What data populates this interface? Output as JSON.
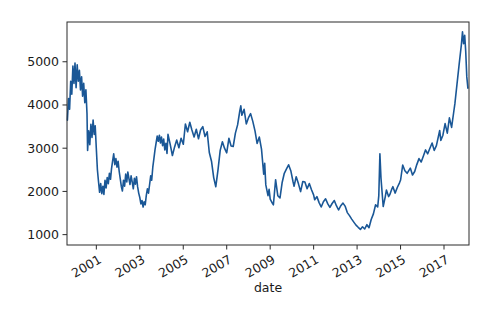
{
  "figure": {
    "background": "#ffffff",
    "frame_color": "#2b2b2b",
    "tick_color": "#2b2b2b",
    "label_color": "#1a1a1a"
  },
  "chart_data": {
    "type": "line",
    "xlabel": "date",
    "ylabel": "",
    "x_ticks": [
      2001,
      2003,
      2005,
      2007,
      2009,
      2011,
      2013,
      2015,
      2017
    ],
    "y_ticks": [
      1000,
      2000,
      3000,
      4000,
      5000
    ],
    "xlim": [
      1999.65,
      2018.15
    ],
    "ylim": [
      760,
      5920
    ],
    "grid": false,
    "legend": "none",
    "line_color": "#1a5796",
    "series": [
      {
        "name": "value",
        "points": [
          [
            1999.67,
            3650
          ],
          [
            1999.72,
            4150
          ],
          [
            1999.77,
            3900
          ],
          [
            1999.82,
            4550
          ],
          [
            1999.87,
            4250
          ],
          [
            1999.92,
            4900
          ],
          [
            1999.97,
            4500
          ],
          [
            2000.02,
            4970
          ],
          [
            2000.07,
            4400
          ],
          [
            2000.12,
            4930
          ],
          [
            2000.17,
            4550
          ],
          [
            2000.22,
            4800
          ],
          [
            2000.27,
            4350
          ],
          [
            2000.32,
            4650
          ],
          [
            2000.37,
            4200
          ],
          [
            2000.42,
            4500
          ],
          [
            2000.47,
            4050
          ],
          [
            2000.52,
            4350
          ],
          [
            2000.57,
            3800
          ],
          [
            2000.6,
            2950
          ],
          [
            2000.65,
            3400
          ],
          [
            2000.7,
            3080
          ],
          [
            2000.75,
            3550
          ],
          [
            2000.8,
            3250
          ],
          [
            2000.85,
            3650
          ],
          [
            2000.9,
            3320
          ],
          [
            2000.95,
            3520
          ],
          [
            2001.0,
            3000
          ],
          [
            2001.05,
            2500
          ],
          [
            2001.1,
            2230
          ],
          [
            2001.15,
            1980
          ],
          [
            2001.2,
            2180
          ],
          [
            2001.25,
            1950
          ],
          [
            2001.3,
            2120
          ],
          [
            2001.35,
            1930
          ],
          [
            2001.4,
            2260
          ],
          [
            2001.45,
            2080
          ],
          [
            2001.5,
            2320
          ],
          [
            2001.55,
            2180
          ],
          [
            2001.6,
            2420
          ],
          [
            2001.65,
            2280
          ],
          [
            2001.7,
            2520
          ],
          [
            2001.75,
            2700
          ],
          [
            2001.8,
            2870
          ],
          [
            2001.85,
            2620
          ],
          [
            2001.9,
            2760
          ],
          [
            2001.95,
            2560
          ],
          [
            2002.0,
            2700
          ],
          [
            2002.05,
            2460
          ],
          [
            2002.1,
            2300
          ],
          [
            2002.15,
            2120
          ],
          [
            2002.2,
            2010
          ],
          [
            2002.25,
            2260
          ],
          [
            2002.3,
            2120
          ],
          [
            2002.35,
            2400
          ],
          [
            2002.4,
            2220
          ],
          [
            2002.45,
            2450
          ],
          [
            2002.5,
            2300
          ],
          [
            2002.55,
            2160
          ],
          [
            2002.6,
            2360
          ],
          [
            2002.65,
            2220
          ],
          [
            2002.7,
            2060
          ],
          [
            2002.75,
            2300
          ],
          [
            2002.8,
            2170
          ],
          [
            2002.85,
            2340
          ],
          [
            2002.9,
            2110
          ],
          [
            2002.95,
            1960
          ],
          [
            2003.0,
            1860
          ],
          [
            2003.05,
            1710
          ],
          [
            2003.1,
            1790
          ],
          [
            2003.15,
            1640
          ],
          [
            2003.2,
            1760
          ],
          [
            2003.25,
            1690
          ],
          [
            2003.3,
            1910
          ],
          [
            2003.35,
            2060
          ],
          [
            2003.4,
            1960
          ],
          [
            2003.45,
            2160
          ],
          [
            2003.5,
            2360
          ],
          [
            2003.55,
            2260
          ],
          [
            2003.6,
            2560
          ],
          [
            2003.65,
            2760
          ],
          [
            2003.7,
            2960
          ],
          [
            2003.75,
            3120
          ],
          [
            2003.8,
            3280
          ],
          [
            2003.85,
            3160
          ],
          [
            2003.9,
            3300
          ],
          [
            2003.95,
            3120
          ],
          [
            2004.0,
            3260
          ],
          [
            2004.05,
            3060
          ],
          [
            2004.1,
            3210
          ],
          [
            2004.15,
            2960
          ],
          [
            2004.2,
            3110
          ],
          [
            2004.25,
            2880
          ],
          [
            2004.3,
            3320
          ],
          [
            2004.4,
            3090
          ],
          [
            2004.5,
            2830
          ],
          [
            2004.6,
            3030
          ],
          [
            2004.7,
            3190
          ],
          [
            2004.8,
            3010
          ],
          [
            2004.9,
            3230
          ],
          [
            2005.0,
            3090
          ],
          [
            2005.1,
            3560
          ],
          [
            2005.2,
            3380
          ],
          [
            2005.3,
            3600
          ],
          [
            2005.4,
            3420
          ],
          [
            2005.5,
            3260
          ],
          [
            2005.6,
            3440
          ],
          [
            2005.7,
            3220
          ],
          [
            2005.8,
            3420
          ],
          [
            2005.9,
            3500
          ],
          [
            2006.0,
            3270
          ],
          [
            2006.1,
            3380
          ],
          [
            2006.2,
            2900
          ],
          [
            2006.3,
            2700
          ],
          [
            2006.4,
            2320
          ],
          [
            2006.5,
            2110
          ],
          [
            2006.6,
            2500
          ],
          [
            2006.7,
            2950
          ],
          [
            2006.8,
            3150
          ],
          [
            2006.9,
            3000
          ],
          [
            2007.0,
            2890
          ],
          [
            2007.1,
            3230
          ],
          [
            2007.2,
            3050
          ],
          [
            2007.3,
            3040
          ],
          [
            2007.4,
            3350
          ],
          [
            2007.5,
            3540
          ],
          [
            2007.6,
            3860
          ],
          [
            2007.65,
            3980
          ],
          [
            2007.7,
            3760
          ],
          [
            2007.8,
            3900
          ],
          [
            2007.9,
            3560
          ],
          [
            2008.0,
            3700
          ],
          [
            2008.1,
            3800
          ],
          [
            2008.2,
            3620
          ],
          [
            2008.3,
            3400
          ],
          [
            2008.4,
            3110
          ],
          [
            2008.5,
            3260
          ],
          [
            2008.6,
            2980
          ],
          [
            2008.7,
            2400
          ],
          [
            2008.75,
            2650
          ],
          [
            2008.8,
            2150
          ],
          [
            2008.9,
            1900
          ],
          [
            2008.95,
            2050
          ],
          [
            2009.0,
            1820
          ],
          [
            2009.1,
            1730
          ],
          [
            2009.15,
            1690
          ],
          [
            2009.25,
            2270
          ],
          [
            2009.35,
            1900
          ],
          [
            2009.45,
            1850
          ],
          [
            2009.55,
            2200
          ],
          [
            2009.65,
            2420
          ],
          [
            2009.75,
            2520
          ],
          [
            2009.85,
            2615
          ],
          [
            2009.95,
            2480
          ],
          [
            2010.05,
            2230
          ],
          [
            2010.1,
            2120
          ],
          [
            2010.2,
            2340
          ],
          [
            2010.3,
            2180
          ],
          [
            2010.4,
            1995
          ],
          [
            2010.5,
            2230
          ],
          [
            2010.6,
            2215
          ],
          [
            2010.7,
            2060
          ],
          [
            2010.8,
            2180
          ],
          [
            2010.9,
            2040
          ],
          [
            2011.0,
            1920
          ],
          [
            2011.05,
            1805
          ],
          [
            2011.15,
            1880
          ],
          [
            2011.25,
            1740
          ],
          [
            2011.35,
            1640
          ],
          [
            2011.45,
            1760
          ],
          [
            2011.55,
            1830
          ],
          [
            2011.65,
            1710
          ],
          [
            2011.75,
            1630
          ],
          [
            2011.85,
            1720
          ],
          [
            2011.95,
            1790
          ],
          [
            2012.05,
            1670
          ],
          [
            2012.15,
            1570
          ],
          [
            2012.25,
            1670
          ],
          [
            2012.35,
            1730
          ],
          [
            2012.45,
            1660
          ],
          [
            2012.55,
            1510
          ],
          [
            2012.65,
            1440
          ],
          [
            2012.75,
            1360
          ],
          [
            2012.85,
            1290
          ],
          [
            2012.95,
            1220
          ],
          [
            2013.05,
            1170
          ],
          [
            2013.15,
            1120
          ],
          [
            2013.25,
            1180
          ],
          [
            2013.35,
            1130
          ],
          [
            2013.45,
            1230
          ],
          [
            2013.55,
            1160
          ],
          [
            2013.65,
            1350
          ],
          [
            2013.75,
            1480
          ],
          [
            2013.85,
            1690
          ],
          [
            2013.95,
            1640
          ],
          [
            2014.0,
            1900
          ],
          [
            2014.05,
            2870
          ],
          [
            2014.1,
            2300
          ],
          [
            2014.2,
            1650
          ],
          [
            2014.3,
            1880
          ],
          [
            2014.35,
            2030
          ],
          [
            2014.45,
            1880
          ],
          [
            2014.5,
            1920
          ],
          [
            2014.6,
            2060
          ],
          [
            2014.65,
            2110
          ],
          [
            2014.75,
            1960
          ],
          [
            2014.85,
            2090
          ],
          [
            2014.95,
            2200
          ],
          [
            2015.0,
            2265
          ],
          [
            2015.1,
            2610
          ],
          [
            2015.2,
            2480
          ],
          [
            2015.3,
            2420
          ],
          [
            2015.45,
            2540
          ],
          [
            2015.55,
            2380
          ],
          [
            2015.65,
            2460
          ],
          [
            2015.75,
            2620
          ],
          [
            2015.85,
            2760
          ],
          [
            2015.95,
            2680
          ],
          [
            2016.05,
            2820
          ],
          [
            2016.15,
            2960
          ],
          [
            2016.25,
            2870
          ],
          [
            2016.35,
            3000
          ],
          [
            2016.45,
            3120
          ],
          [
            2016.55,
            2950
          ],
          [
            2016.65,
            3060
          ],
          [
            2016.8,
            3410
          ],
          [
            2016.85,
            3180
          ],
          [
            2016.95,
            3300
          ],
          [
            2017.05,
            3570
          ],
          [
            2017.15,
            3350
          ],
          [
            2017.25,
            3700
          ],
          [
            2017.35,
            3480
          ],
          [
            2017.45,
            3850
          ],
          [
            2017.5,
            4030
          ],
          [
            2017.6,
            4480
          ],
          [
            2017.7,
            4950
          ],
          [
            2017.8,
            5400
          ],
          [
            2017.85,
            5690
          ],
          [
            2017.9,
            5420
          ],
          [
            2017.95,
            5610
          ],
          [
            2018.0,
            5250
          ],
          [
            2018.05,
            4650
          ],
          [
            2018.1,
            4390
          ]
        ]
      }
    ]
  }
}
